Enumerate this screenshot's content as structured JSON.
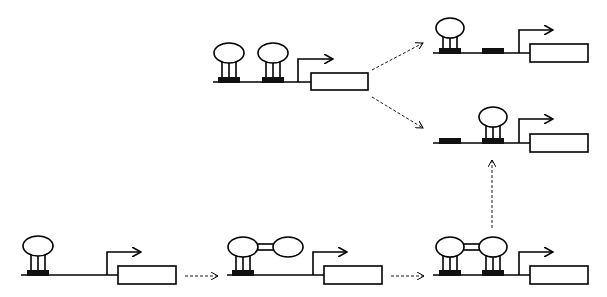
{
  "diagram": {
    "type": "gene-regulation-schematic",
    "colors": {
      "line": "#000000",
      "binding_site": "#111111",
      "background": "#ffffff"
    },
    "panels": [
      {
        "id": "top-middle",
        "description": "Two proteins bound at two sites upstream of promoter",
        "sites": 2,
        "bound": [
          true,
          true
        ],
        "bridged": false
      },
      {
        "id": "top-right",
        "description": "Protein bound at first site only",
        "sites": 2,
        "bound": [
          true,
          false
        ],
        "bridged": false
      },
      {
        "id": "middle-right",
        "description": "Protein bound at second site only",
        "sites": 2,
        "bound": [
          false,
          true
        ],
        "bridged": false
      },
      {
        "id": "bottom-left",
        "description": "Single protein bound at single site",
        "sites": 1,
        "bound": [
          true
        ],
        "bridged": false
      },
      {
        "id": "bottom-middle",
        "description": "Bound protein dimerized with free protein",
        "sites": 1,
        "bound": [
          true
        ],
        "bridged": true
      },
      {
        "id": "bottom-right",
        "description": "Two bridged proteins bound at two sites",
        "sites": 2,
        "bound": [
          true,
          true
        ],
        "bridged": true
      }
    ],
    "arrows": [
      {
        "from": "top-middle",
        "to": "top-right",
        "style": "dashed"
      },
      {
        "from": "top-middle",
        "to": "middle-right",
        "style": "dashed"
      },
      {
        "from": "bottom-left",
        "to": "bottom-middle",
        "style": "dashed"
      },
      {
        "from": "bottom-middle",
        "to": "bottom-right",
        "style": "dashed"
      },
      {
        "from": "bottom-right",
        "to": "middle-right",
        "style": "dashed"
      }
    ]
  }
}
